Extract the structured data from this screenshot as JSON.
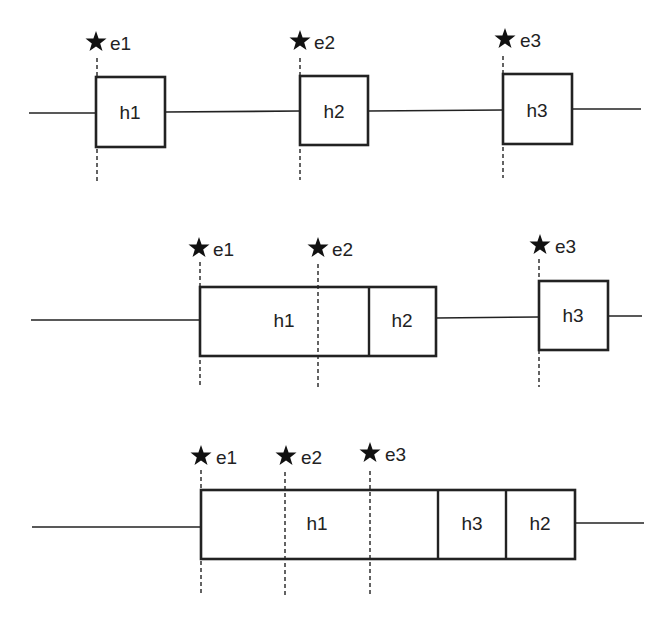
{
  "rows": [
    {
      "events": [
        {
          "label": "e1",
          "x": 97
        },
        {
          "label": "e2",
          "x": 300
        },
        {
          "label": "e3",
          "x": 503
        }
      ],
      "boxes": [
        {
          "label": "h1"
        },
        {
          "label": "h2"
        },
        {
          "label": "h3"
        }
      ]
    },
    {
      "events": [
        {
          "label": "e1",
          "x": 200
        },
        {
          "label": "e2",
          "x": 318
        },
        {
          "label": "e3",
          "x": 539
        }
      ],
      "boxes": [
        {
          "label": "h1"
        },
        {
          "label": "h2"
        },
        {
          "label": "h3"
        }
      ]
    },
    {
      "events": [
        {
          "label": "e1",
          "x": 201
        },
        {
          "label": "e2",
          "x": 285
        },
        {
          "label": "e3",
          "x": 370
        }
      ],
      "boxes": [
        {
          "label": "h1"
        },
        {
          "label": "h3"
        },
        {
          "label": "h2"
        }
      ]
    }
  ],
  "colors": {
    "stroke": "#222222",
    "background": "#ffffff"
  }
}
